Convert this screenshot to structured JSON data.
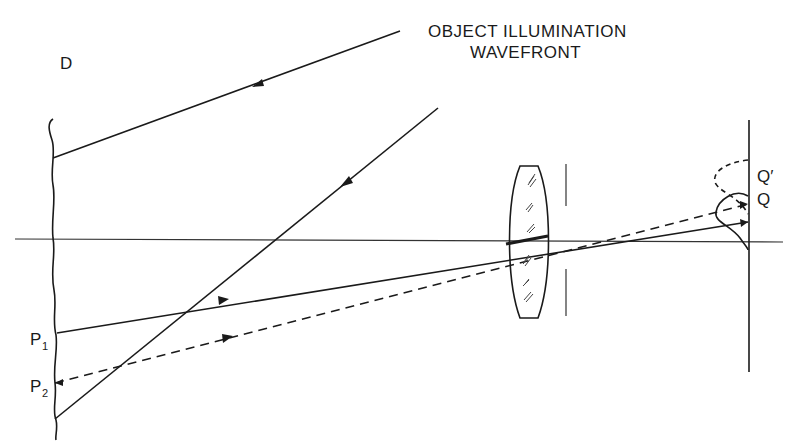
{
  "title": {
    "line1": "OBJECT ILLUMINATION",
    "line2": "WAVEFRONT"
  },
  "labels": {
    "D": "D",
    "P1_main": "P",
    "P1_sub": "1",
    "P2_main": "P",
    "P2_sub": "2",
    "Q": "Q",
    "Q_prime": "Q′"
  },
  "colors": {
    "ink": "#1a1a1a",
    "background": "#ffffff"
  }
}
